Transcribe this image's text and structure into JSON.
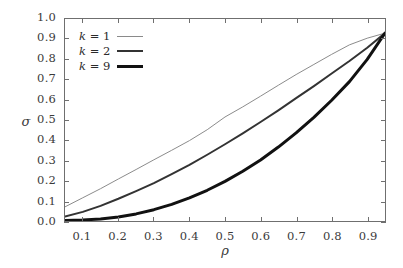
{
  "chart_data": {
    "type": "line",
    "title": "",
    "subtitle": "",
    "xlabel": "ρ",
    "ylabel": "σ",
    "xlim": [
      0.05,
      0.95
    ],
    "ylim": [
      0.0,
      1.0
    ],
    "grid": false,
    "legend_position": "top-left-inside",
    "xticks": [
      "0.1",
      "0.2",
      "0.3",
      "0.4",
      "0.5",
      "0.6",
      "0.7",
      "0.8",
      "0.9"
    ],
    "xtick_values": [
      0.1,
      0.2,
      0.3,
      0.4,
      0.5,
      0.6,
      0.7,
      0.8,
      0.9
    ],
    "yticks": [
      "0.0",
      "0.1",
      "0.2",
      "0.3",
      "0.4",
      "0.5",
      "0.6",
      "0.7",
      "0.8",
      "0.9",
      "1.0"
    ],
    "ytick_values": [
      0.0,
      0.1,
      0.2,
      0.3,
      0.4,
      0.5,
      0.6,
      0.7,
      0.8,
      0.9,
      1.0
    ],
    "x": [
      0.05,
      0.1,
      0.15,
      0.2,
      0.25,
      0.3,
      0.35,
      0.4,
      0.45,
      0.5,
      0.55,
      0.6,
      0.65,
      0.7,
      0.75,
      0.8,
      0.85,
      0.9,
      0.95
    ],
    "series": [
      {
        "name": "k = 1",
        "k": 1,
        "color": "#8a8a8a",
        "line_width": 1,
        "values": [
          0.07,
          0.115,
          0.16,
          0.208,
          0.255,
          0.303,
          0.35,
          0.398,
          0.452,
          0.515,
          0.565,
          0.618,
          0.672,
          0.725,
          0.775,
          0.825,
          0.872,
          0.905,
          0.93
        ]
      },
      {
        "name": "k = 2",
        "k": 2,
        "color": "#333333",
        "line_width": 2,
        "values": [
          0.022,
          0.045,
          0.075,
          0.11,
          0.148,
          0.188,
          0.232,
          0.278,
          0.328,
          0.38,
          0.434,
          0.49,
          0.548,
          0.608,
          0.668,
          0.73,
          0.792,
          0.858,
          0.93
        ]
      },
      {
        "name": "k = 9",
        "k": 9,
        "color": "#111111",
        "line_width": 3,
        "values": [
          0.002,
          0.005,
          0.01,
          0.02,
          0.035,
          0.056,
          0.082,
          0.114,
          0.152,
          0.196,
          0.246,
          0.302,
          0.366,
          0.436,
          0.513,
          0.598,
          0.69,
          0.8,
          0.93
        ]
      }
    ]
  },
  "legend": {
    "items": [
      {
        "label_prefix": "k",
        "label_eq": "=",
        "label_value": "1"
      },
      {
        "label_prefix": "k",
        "label_eq": "=",
        "label_value": "2"
      },
      {
        "label_prefix": "k",
        "label_eq": "=",
        "label_value": "9"
      }
    ]
  },
  "axes": {
    "ylabel": "σ",
    "xlabel": "ρ"
  }
}
